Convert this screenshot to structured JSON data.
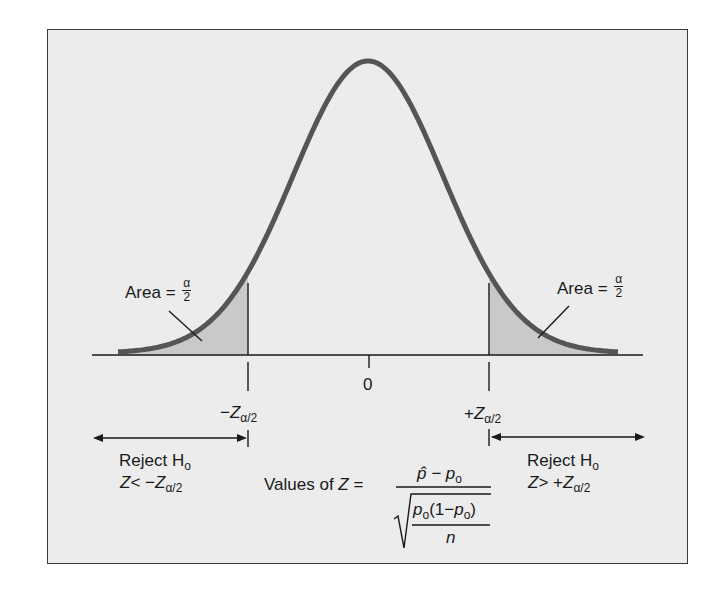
{
  "diagram": {
    "type": "two-tailed hypothesis test, standard normal distribution",
    "colors": {
      "background": "#ffffff",
      "panel": "#ececec",
      "curve": "#555555",
      "shaded_tail": "#c9c9c9",
      "lines": "#1a1a1a"
    },
    "left_tail": {
      "area_label": "Area =",
      "area_frac_num": "α",
      "area_frac_den": "2",
      "critical_sign": "−",
      "critical_var": "Z",
      "critical_sub": "α/2",
      "reject_label": "Reject H",
      "reject_sub": "o",
      "cond_var": "Z",
      "cond_op": "< −",
      "cond_rhs_var": "Z",
      "cond_rhs_sub": "α/2"
    },
    "center": {
      "tick_label": "0"
    },
    "right_tail": {
      "area_label": "Area =",
      "area_frac_num": "α",
      "area_frac_den": "2",
      "critical_sign": "+",
      "critical_var": "Z",
      "critical_sub": "α/2",
      "reject_label": "Reject H",
      "reject_sub": "o",
      "cond_var": "Z",
      "cond_op": "> +",
      "cond_rhs_var": "Z",
      "cond_rhs_sub": "α/2"
    },
    "formula": {
      "prefix": "Values of",
      "var": "Z",
      "equals": "=",
      "numerator": "p̂ − p",
      "numerator_sub": "o",
      "radicand_p1": "p",
      "radicand_sub1": "o",
      "radicand_mid": "(1−",
      "radicand_p2": "p",
      "radicand_sub2": "o",
      "radicand_close": ")",
      "radicand_den": "n"
    }
  }
}
